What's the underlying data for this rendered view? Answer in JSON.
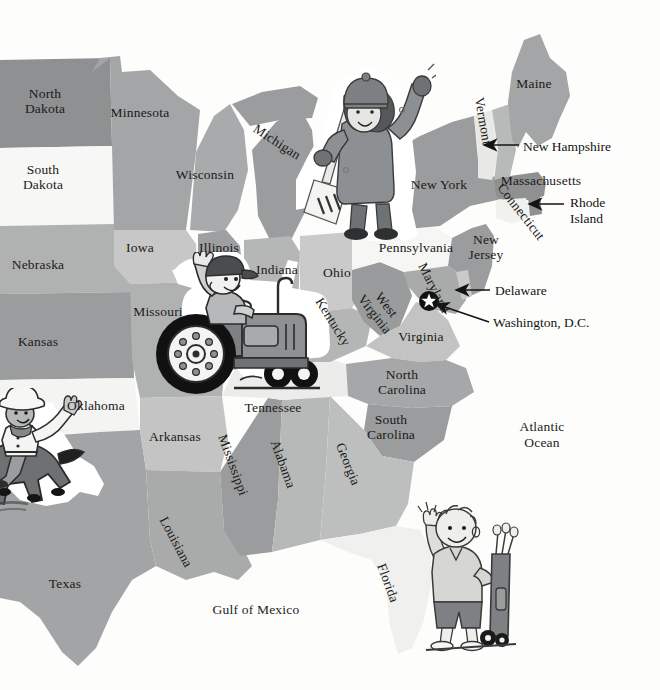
{
  "map": {
    "title": "Eastern United States illustrated map",
    "background_color": "#fdfdfc",
    "label_color": "#1a1a18",
    "palette": {
      "gray_dark": "#8e9091",
      "gray_mid": "#a3a5a6",
      "gray_light": "#bdbfbf",
      "gray_pale": "#d4d5d4",
      "near_white": "#f2f2f0",
      "white": "#ffffff"
    },
    "states": [
      {
        "name": "North Dakota",
        "label": "North\nDakota",
        "x": 45,
        "y": 102,
        "rotation": 0,
        "fill": "#8e9091"
      },
      {
        "name": "South Dakota",
        "label": "South\nDakota",
        "x": 43,
        "y": 178,
        "rotation": 0,
        "fill": "#f7f7f5"
      },
      {
        "name": "Minnesota",
        "label": "Minnesota",
        "x": 140,
        "y": 113,
        "rotation": 0,
        "fill": "#a3a5a6"
      },
      {
        "name": "Wisconsin",
        "label": "Wisconsin",
        "x": 205,
        "y": 175,
        "rotation": 0,
        "fill": "#a8aaab"
      },
      {
        "name": "Michigan",
        "label": "Michigan",
        "x": 277,
        "y": 142,
        "rotation": 33,
        "fill": "#9a9c9d"
      },
      {
        "name": "Nebraska",
        "label": "Nebraska",
        "x": 38,
        "y": 265,
        "rotation": 0,
        "fill": "#b0b2b2"
      },
      {
        "name": "Iowa",
        "label": "Iowa",
        "x": 140,
        "y": 248,
        "rotation": 0,
        "fill": "#c6c7c6"
      },
      {
        "name": "Illinois",
        "label": "Illinois",
        "x": 219,
        "y": 248,
        "rotation": 0,
        "fill": "#9d9fa0"
      },
      {
        "name": "Indiana",
        "label": "Indiana",
        "x": 277,
        "y": 270,
        "rotation": 0,
        "fill": "#b5b7b7"
      },
      {
        "name": "Ohio",
        "label": "Ohio",
        "x": 337,
        "y": 273,
        "rotation": 0,
        "fill": "#c9cac9"
      },
      {
        "name": "Missouri",
        "label": "Missouri",
        "x": 158,
        "y": 312,
        "rotation": 0,
        "fill": "#b0b2b2"
      },
      {
        "name": "Kansas",
        "label": "Kansas",
        "x": 38,
        "y": 342,
        "rotation": 0,
        "fill": "#9a9c9d"
      },
      {
        "name": "Oklahoma",
        "label": "Oklahoma",
        "x": 96,
        "y": 406,
        "rotation": 0,
        "fill": "#f4f4f2"
      },
      {
        "name": "Texas",
        "label": "Texas",
        "x": 65,
        "y": 584,
        "rotation": 0,
        "fill": "#a2a4a5"
      },
      {
        "name": "Arkansas",
        "label": "Arkansas",
        "x": 175,
        "y": 437,
        "rotation": 0,
        "fill": "#c3c4c3"
      },
      {
        "name": "Louisiana",
        "label": "Louisiana",
        "x": 176,
        "y": 542,
        "rotation": 62,
        "fill": "#a9abab"
      },
      {
        "name": "Mississippi",
        "label": "Mississippi",
        "x": 233,
        "y": 465,
        "rotation": 70,
        "fill": "#9a9c9d"
      },
      {
        "name": "Alabama",
        "label": "Alabama",
        "x": 283,
        "y": 464,
        "rotation": 70,
        "fill": "#b7b9b9"
      },
      {
        "name": "Tennessee",
        "label": "Tennessee",
        "x": 273,
        "y": 408,
        "rotation": 0,
        "fill": "#ececeb"
      },
      {
        "name": "Kentucky",
        "label": "Kentucky",
        "x": 333,
        "y": 322,
        "rotation": 58,
        "fill": "#b4b6b6"
      },
      {
        "name": "West Virginia",
        "label": "West\nVirginia",
        "x": 380,
        "y": 310,
        "rotation": 52,
        "fill": "#999b9c"
      },
      {
        "name": "Virginia",
        "label": "Virginia",
        "x": 421,
        "y": 337,
        "rotation": 0,
        "fill": "#c2c3c2"
      },
      {
        "name": "North Carolina",
        "label": "North\nCarolina",
        "x": 402,
        "y": 383,
        "rotation": 0,
        "fill": "#a5a7a8"
      },
      {
        "name": "South Carolina",
        "label": "South\nCarolina",
        "x": 391,
        "y": 428,
        "rotation": 0,
        "fill": "#9a9c9d"
      },
      {
        "name": "Georgia",
        "label": "Georgia",
        "x": 348,
        "y": 464,
        "rotation": 68,
        "fill": "#bdbfbf"
      },
      {
        "name": "Florida",
        "label": "Florida",
        "x": 388,
        "y": 583,
        "rotation": 70,
        "fill": "#f0f0ee"
      },
      {
        "name": "Pennsylvania",
        "label": "Pennsylvania",
        "x": 416,
        "y": 248,
        "rotation": 0,
        "fill": "#f6f6f4"
      },
      {
        "name": "New York",
        "label": "New York",
        "x": 439,
        "y": 185,
        "rotation": 0,
        "fill": "#9a9c9d"
      },
      {
        "name": "Vermont",
        "label": "Vermont",
        "x": 483,
        "y": 121,
        "rotation": 80,
        "fill": "#e8e8e6"
      },
      {
        "name": "Maine",
        "label": "Maine",
        "x": 534,
        "y": 84,
        "rotation": 0,
        "fill": "#a3a5a6"
      },
      {
        "name": "Massachusetts",
        "label": "Massachusetts",
        "x": 541,
        "y": 181,
        "rotation": 0,
        "fill": "#8e9091"
      },
      {
        "name": "Connecticut",
        "label": "Connecticut",
        "x": 521,
        "y": 212,
        "rotation": 52,
        "fill": "#f1f1ef"
      },
      {
        "name": "New Jersey",
        "label": "New\nJersey",
        "x": 486,
        "y": 248,
        "rotation": 0,
        "fill": "#9a9c9d"
      },
      {
        "name": "Maryland",
        "label": "Maryland",
        "x": 434,
        "y": 288,
        "rotation": 63,
        "fill": "#a9abab"
      }
    ],
    "callouts": [
      {
        "name": "New Hampshire",
        "label": "New Hampshire",
        "text_x": 523,
        "text_y": 139,
        "arrow_from_x": 519,
        "arrow_from_y": 145,
        "arrow_to_x": 483,
        "arrow_to_y": 145
      },
      {
        "name": "Rhode Island",
        "label": "Rhode\nIsland",
        "text_x": 570,
        "text_y": 195,
        "arrow_from_x": 565,
        "arrow_from_y": 204,
        "arrow_to_x": 528,
        "arrow_to_y": 204
      },
      {
        "name": "Delaware",
        "label": "Delaware",
        "text_x": 495,
        "text_y": 283,
        "arrow_from_x": 490,
        "arrow_from_y": 290,
        "arrow_to_x": 455,
        "arrow_to_y": 290
      },
      {
        "name": "Washington, D.C.",
        "label": "Washington, D.C.",
        "text_x": 493,
        "text_y": 315,
        "arrow_from_x": 489,
        "arrow_from_y": 322,
        "arrow_to_x": 434,
        "arrow_to_y": 303
      }
    ],
    "markers": [
      {
        "name": "washington-dc-star",
        "symbol": "star",
        "x": 428,
        "y": 300
      }
    ],
    "water_labels": [
      {
        "name": "Atlantic Ocean",
        "label": "Atlantic\nOcean",
        "x": 542,
        "y": 435
      },
      {
        "name": "Gulf of Mexico",
        "label": "Gulf of Mexico",
        "x": 256,
        "y": 610
      }
    ],
    "illustrations": [
      {
        "name": "snow-shoveler-girl",
        "description": "Girl in winter coat and hat waving, holding a snow shovel",
        "x": 300,
        "y": 55,
        "width": 130,
        "height": 180
      },
      {
        "name": "farmer-on-tractor",
        "description": "Farmer waving while driving a tractor",
        "x": 140,
        "y": 255,
        "width": 195,
        "height": 155
      },
      {
        "name": "cowboy-on-horse",
        "description": "Cowboy in hat waving from a galloping horse",
        "x": -10,
        "y": 390,
        "width": 110,
        "height": 125
      },
      {
        "name": "golfer-boy",
        "description": "Boy waving beside a golf bag on wheels",
        "x": 395,
        "y": 495,
        "width": 120,
        "height": 155
      }
    ]
  }
}
